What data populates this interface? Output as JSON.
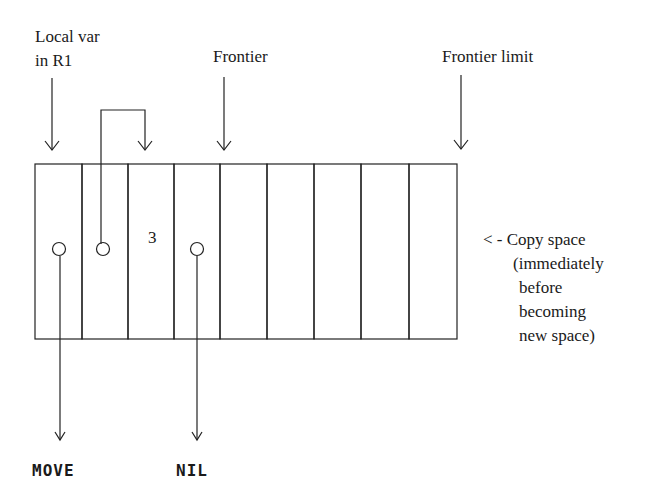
{
  "labels": {
    "local_var_line1": "Local var",
    "local_var_line2": "in R1",
    "frontier": "Frontier",
    "frontier_limit": "Frontier limit",
    "copy_space": [
      "< - Copy space",
      "(immediately",
      "before",
      "becoming",
      "new space)"
    ],
    "cell_value": "3",
    "move": "MOVE",
    "nil": "NIL"
  },
  "grid": {
    "cells": 9
  },
  "colors": {
    "stroke": "#222222",
    "text": "#1a1a1a",
    "background": "#ffffff"
  }
}
